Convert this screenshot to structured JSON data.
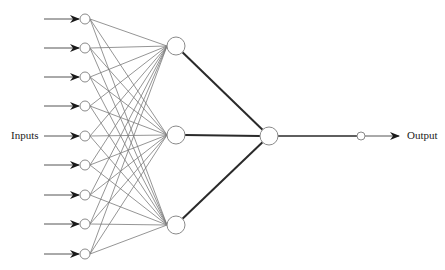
{
  "diagram": {
    "type": "feedforward-neural-network",
    "labels": {
      "inputs": "Inputs",
      "output": "Output"
    },
    "colors": {
      "background": "#ffffff",
      "thin_edge": "#7a7a7a",
      "thick_edge": "#2a2a2a",
      "node_stroke": "#8a8a8a",
      "arrow": "#1a1a1a"
    },
    "layers": {
      "input": {
        "count": 9,
        "x": 85,
        "radius": 5,
        "y": [
          19,
          48,
          77,
          106,
          136,
          165,
          195,
          224,
          254
        ]
      },
      "hidden": {
        "count": 3,
        "x": 176,
        "radius": 9,
        "y": [
          46,
          135,
          225
        ]
      },
      "combiner": {
        "count": 1,
        "x": 269,
        "y": 136,
        "radius": 9
      },
      "output": {
        "count": 1,
        "x": 361,
        "y": 136,
        "radius": 4
      }
    },
    "input_arrows": {
      "x_start": 44,
      "x_end": 79
    },
    "output_arrow": {
      "x_start": 365,
      "x_end": 399,
      "y": 136
    }
  }
}
